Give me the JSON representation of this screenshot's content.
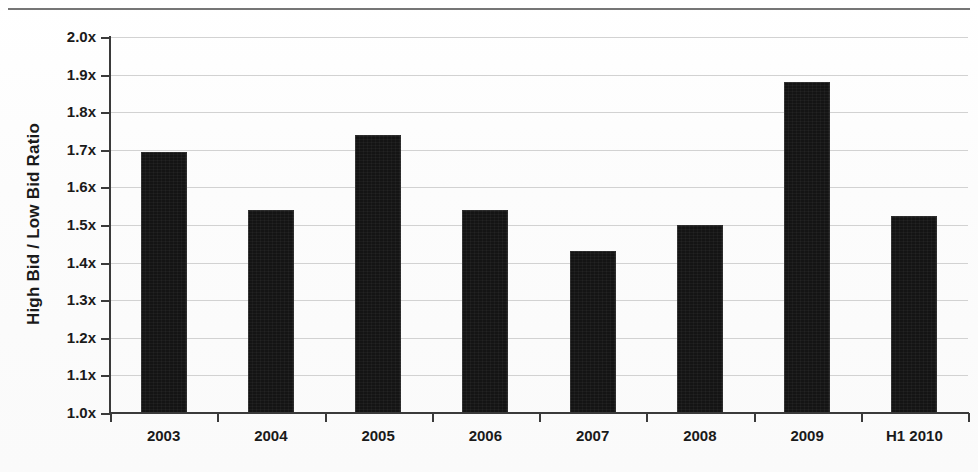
{
  "chart_data": {
    "type": "bar",
    "title": "",
    "xlabel": "",
    "ylabel": "High Bid / Low Bid Ratio",
    "categories": [
      "2003",
      "2004",
      "2005",
      "2006",
      "2007",
      "2008",
      "2009",
      "H1 2010"
    ],
    "values": [
      1.695,
      1.54,
      1.74,
      1.54,
      1.43,
      1.5,
      1.88,
      1.525
    ],
    "ylim": [
      1.0,
      2.0
    ],
    "ytick_values": [
      1.0,
      1.1,
      1.2,
      1.3,
      1.4,
      1.5,
      1.6,
      1.7,
      1.8,
      1.9,
      2.0
    ],
    "ytick_labels": [
      "1.0x",
      "1.1x",
      "1.2x",
      "1.3x",
      "1.4x",
      "1.5x",
      "1.6x",
      "1.7x",
      "1.8x",
      "1.9x",
      "2.0x"
    ],
    "grid": true,
    "legend": false,
    "legend_position": "none",
    "bar_color": "#141414",
    "gridline_color": "#d2d2d2",
    "axis_color": "#3a3a3a",
    "background_color": "#fdfdfd"
  },
  "decoration": {
    "top_rule_color": "#6f6f6f"
  }
}
